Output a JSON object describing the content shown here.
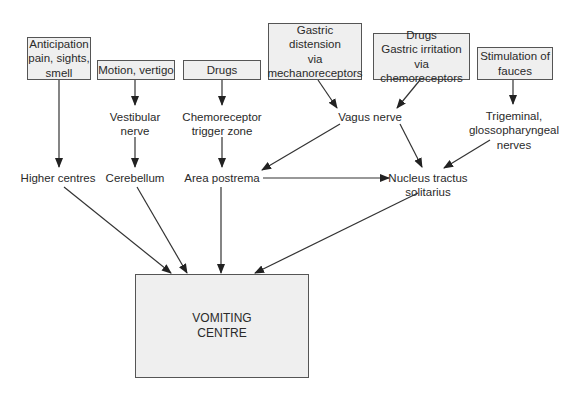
{
  "inputs": [
    {
      "id": "anticipation",
      "label": "Anticipation\npain, sights,\nsmell"
    },
    {
      "id": "motion",
      "label": "Motion, vertigo"
    },
    {
      "id": "drugs",
      "label": "Drugs"
    },
    {
      "id": "gastric_distension",
      "label": "Gastric\ndistension\nvia\nmechanoreceptors"
    },
    {
      "id": "drugs_gastric_irritation",
      "label": "Drugs\nGastric irritation\nvia chemoreceptors"
    },
    {
      "id": "fauces",
      "label": "Stimulation of\nfauces"
    }
  ],
  "intermediate": [
    {
      "id": "vestibular",
      "label": "Vestibular\nnerve"
    },
    {
      "id": "ctz",
      "label": "Chemoreceptor\ntrigger zone"
    },
    {
      "id": "vagus",
      "label": "Vagus nerve"
    },
    {
      "id": "trigeminal",
      "label": "Trigeminal,\nglossopharyngeal\nnerves"
    }
  ],
  "centres": [
    {
      "id": "higher",
      "label": "Higher centres"
    },
    {
      "id": "cerebellum",
      "label": "Cerebellum"
    },
    {
      "id": "area_postrema",
      "label": "Area postrema"
    },
    {
      "id": "nts",
      "label": "Nucleus tractus\nsolitarius"
    }
  ],
  "target": {
    "id": "vomiting_centre",
    "label": "VOMITING\nCENTRE"
  },
  "edges": [
    [
      "anticipation",
      "higher"
    ],
    [
      "motion",
      "vestibular"
    ],
    [
      "vestibular",
      "cerebellum"
    ],
    [
      "drugs",
      "ctz"
    ],
    [
      "ctz",
      "area_postrema"
    ],
    [
      "gastric_distension",
      "vagus"
    ],
    [
      "drugs_gastric_irritation",
      "vagus"
    ],
    [
      "vagus",
      "area_postrema"
    ],
    [
      "vagus",
      "nts"
    ],
    [
      "fauces",
      "trigeminal"
    ],
    [
      "trigeminal",
      "nts"
    ],
    [
      "area_postrema",
      "nts"
    ],
    [
      "higher",
      "vomiting_centre"
    ],
    [
      "cerebellum",
      "vomiting_centre"
    ],
    [
      "area_postrema",
      "vomiting_centre"
    ],
    [
      "nts",
      "vomiting_centre"
    ]
  ]
}
